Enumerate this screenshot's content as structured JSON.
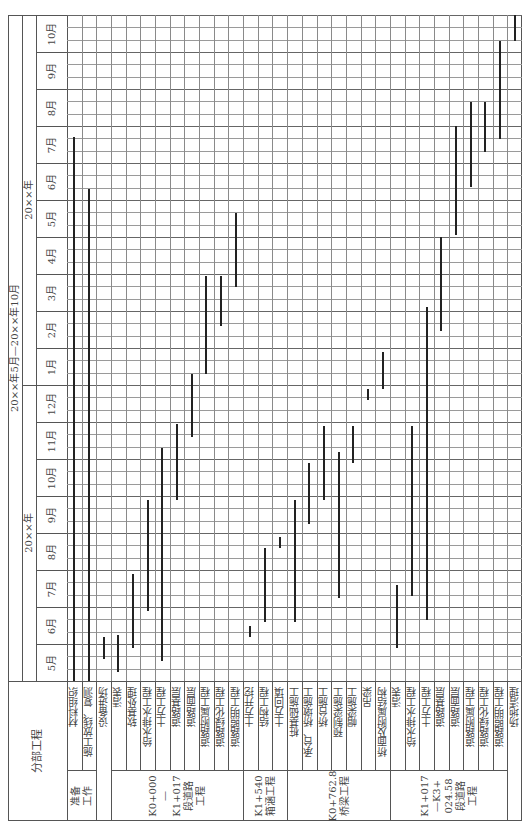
{
  "header": {
    "overall_period": "20××年5月—20××年10月",
    "year1": "20××年",
    "year2": "20××年",
    "section_header": "分部工程"
  },
  "months": [
    "5月",
    "6月",
    "7月",
    "8月",
    "9月",
    "10月",
    "11月",
    "12月",
    "1月",
    "2月",
    "3月",
    "4月",
    "5月",
    "6月",
    "7月",
    "8月",
    "9月",
    "10月"
  ],
  "groups": [
    {
      "label": "准备\n工作",
      "rows": [
        0,
        1
      ]
    },
    {
      "label": "",
      "rows": [
        2
      ]
    },
    {
      "label": "K0+000\n—\nK1+017\n段道路\n工程",
      "rows": [
        3,
        4,
        5,
        6,
        7,
        8,
        9,
        10,
        11
      ]
    },
    {
      "label": "K1+540\n箱涵工程",
      "rows": [
        12,
        13,
        14
      ]
    },
    {
      "label": "K0+762.8\n桥梁工程",
      "rows": [
        15,
        16,
        17,
        18,
        19,
        20,
        21
      ]
    },
    {
      "label": "K1+017\n—K3+\n024.58\n段道路\n工程",
      "rows": [
        22,
        23,
        24,
        25,
        26,
        27,
        28,
        29
      ]
    },
    {
      "label": "",
      "rows": [
        30
      ]
    }
  ],
  "chart_data": {
    "type": "gantt",
    "orientation": "rotated 90° counter-clockwise (time axis vertical, bottom = earliest)",
    "time_axis": {
      "label": "20××年5月—20××年10月",
      "unit": "month",
      "ticks": [
        "5月",
        "6月",
        "7月",
        "8月",
        "9月",
        "10月",
        "11月",
        "12月",
        "1月",
        "2月",
        "3月",
        "4月",
        "5月",
        "6月",
        "7月",
        "8月",
        "9月",
        "10月"
      ],
      "subdivisions_per_month": 3,
      "range_months": [
        0,
        18
      ]
    },
    "tasks": [
      {
        "group": "准备工作",
        "name": "材料组织",
        "start": 0.0,
        "end": 14.7
      },
      {
        "group": "准备工作",
        "name": "施工放线、复测",
        "start": 0.0,
        "end": 13.3
      },
      {
        "group": "",
        "name": "设备进场",
        "start": 0.6,
        "end": 0.6
      },
      {
        "group": "K0+000—K1+017段道路工程",
        "name": "清表",
        "start": 0.25,
        "end": 1.25
      },
      {
        "group": "K0+000—K1+017段道路工程",
        "name": "软基处理",
        "start": 0.9,
        "end": 2.9
      },
      {
        "group": "K0+000—K1+017段道路工程",
        "name": "给水排水工程",
        "start": 1.9,
        "end": 4.9
      },
      {
        "group": "K0+000—K1+017段道路工程",
        "name": "土方工程",
        "start": 0.55,
        "end": 6.3
      },
      {
        "group": "K0+000—K1+017段道路工程",
        "name": "道路基层",
        "start": 4.9,
        "end": 6.95
      },
      {
        "group": "K0+000—K1+017段道路工程",
        "name": "道路面层",
        "start": 6.6,
        "end": 8.3
      },
      {
        "group": "K0+000—K1+017段道路工程",
        "name": "道路附属工程",
        "start": 8.3,
        "end": 10.95
      },
      {
        "group": "K0+000—K1+017段道路工程",
        "name": "道路绿化工程",
        "start": 9.6,
        "end": 10.95
      },
      {
        "group": "K0+000—K1+017段道路工程",
        "name": "道路照明工程",
        "start": 10.65,
        "end": 12.65
      },
      {
        "group": "K1+540箱涵工程",
        "name": "土方开挖",
        "start": 1.2,
        "end": 1.5
      },
      {
        "group": "K1+540箱涵工程",
        "name": "结构工程",
        "start": 1.6,
        "end": 3.6
      },
      {
        "group": "K1+540箱涵工程",
        "name": "土方回填",
        "start": 3.6,
        "end": 3.9
      },
      {
        "group": "K0+762.8桥梁工程",
        "name": "桩基础施工",
        "start": 1.6,
        "end": 4.9
      },
      {
        "group": "K0+762.8桥梁工程",
        "name": "承台、桥墩施工",
        "start": 4.25,
        "end": 5.9
      },
      {
        "group": "K0+762.8桥梁工程",
        "name": "桥台施工",
        "start": 4.9,
        "end": 6.9
      },
      {
        "group": "K0+762.8桥梁工程",
        "name": "预制梁施工",
        "start": 2.25,
        "end": 6.2
      },
      {
        "group": "K0+762.8桥梁工程",
        "name": "帽梁施工",
        "start": 5.9,
        "end": 6.9
      },
      {
        "group": "K0+762.8桥梁工程",
        "name": "吊梁",
        "start": 7.6,
        "end": 7.9
      },
      {
        "group": "K0+762.8桥梁工程",
        "name": "桥面及附属结构",
        "start": 7.9,
        "end": 8.9
      },
      {
        "group": "K1+017—K3+024.58段道路工程",
        "name": "清表",
        "start": 0.9,
        "end": 2.6
      },
      {
        "group": "K1+017—K3+024.58段道路工程",
        "name": "给水排水工程",
        "start": 2.3,
        "end": 6.9
      },
      {
        "group": "K1+017—K3+024.58段道路工程",
        "name": "土方工程",
        "start": 1.65,
        "end": 10.1
      },
      {
        "group": "K1+017—K3+024.58段道路工程",
        "name": "道路基层",
        "start": 9.45,
        "end": 12.0
      },
      {
        "group": "K1+017—K3+024.58段道路工程",
        "name": "道路面层",
        "start": 12.05,
        "end": 15.0
      },
      {
        "group": "K1+017—K3+024.58段道路工程",
        "name": "道路附属工程",
        "start": 13.35,
        "end": 15.65
      },
      {
        "group": "K1+017—K3+024.58段道路工程",
        "name": "道路绿化工程",
        "start": 14.3,
        "end": 15.65
      },
      {
        "group": "K1+017—K3+024.58段道路工程",
        "name": "道路照明工程",
        "start": 14.65,
        "end": 17.3
      },
      {
        "group": "",
        "name": "场地清理",
        "start": 17.3,
        "end": 18.0
      }
    ]
  }
}
